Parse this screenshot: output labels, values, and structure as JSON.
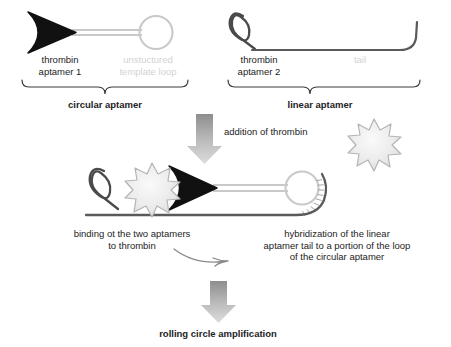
{
  "figure": {
    "colors": {
      "ink": "#232323",
      "aptamer_dark": "#111111",
      "loop_light": "#c9c9c9",
      "faint_text": "#d3d3d3",
      "thrombin_fill": "#ededed",
      "thrombin_stroke": "#b4b4b4",
      "arrow_top": "#8e8e8e",
      "arrow_bottom": "#d8d8d8",
      "brace": "#3a3a3a",
      "background": "#ffffff"
    }
  },
  "top_row": {
    "circular": {
      "part_labels": [
        {
          "text": "thrombin\naptamer 1",
          "style": "dark"
        },
        {
          "text": "unstuctured\ntemplate loop",
          "style": "faint"
        }
      ],
      "brace_label": "circular aptamer"
    },
    "linear": {
      "part_labels": [
        {
          "text": "thrombin\naptamer 2",
          "style": "dark"
        },
        {
          "text": "tail",
          "style": "faint"
        }
      ],
      "brace_label": "linear aptamer"
    }
  },
  "step_one": {
    "arrow_label": "addition of thrombin",
    "reagent_icon": "thrombin-starburst-icon"
  },
  "complex": {
    "left_caption": "binding ot the two aptamers\nto thrombin",
    "right_caption": "hybridization of the linear\naptamer tail to a portion of the loop\nof the circular aptamer",
    "pointer_icon": "curved-pointer-arrow-icon"
  },
  "step_two": {
    "result_label": "rolling circle amplification"
  }
}
